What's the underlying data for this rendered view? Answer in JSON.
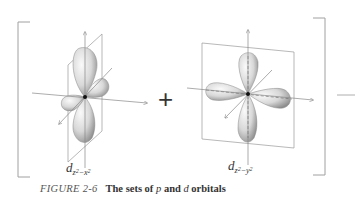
{
  "figure": {
    "caption": {
      "number": "FIGURE 2-6",
      "text_pre": "The sets of ",
      "var1": "p",
      "text_mid": " and ",
      "var2": "d",
      "text_post": " orbitals"
    },
    "operator": "+",
    "orbitals": [
      {
        "name": "d_z2-x2",
        "letter": "d",
        "sub1": "z",
        "sup1": "2",
        "minus": "−",
        "sub2": "x",
        "sup2": "2"
      },
      {
        "name": "d_z2-y2",
        "letter": "d",
        "sub1": "z",
        "sup1": "2",
        "minus": "−",
        "sub2": "y",
        "sup2": "2"
      }
    ],
    "colors": {
      "lobe_light": "#f2f2f2",
      "lobe_dark": "#9a9a9a",
      "axis": "#888888",
      "bracket": "#9a9a9a",
      "nucleus": "#111111"
    }
  }
}
